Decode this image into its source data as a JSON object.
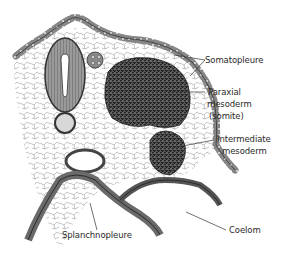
{
  "figure": {
    "colors": {
      "ink": "#2a2a2a",
      "tissue_dark": "#3a3a3a",
      "tissue_mid": "#777777",
      "tissue_light": "#bdbdbd",
      "background": "#ffffff"
    }
  },
  "labels": {
    "somatopleure": "Somatopleure",
    "paraxial_line1": "Paraxial",
    "paraxial_line2": "mesoderm",
    "paraxial_line3": "(somite)",
    "intermediate_line1": "Intermediate",
    "intermediate_line2": "mesoderm",
    "splanchnopleure": "Splanchnopleure",
    "coelom": "Coelom"
  }
}
